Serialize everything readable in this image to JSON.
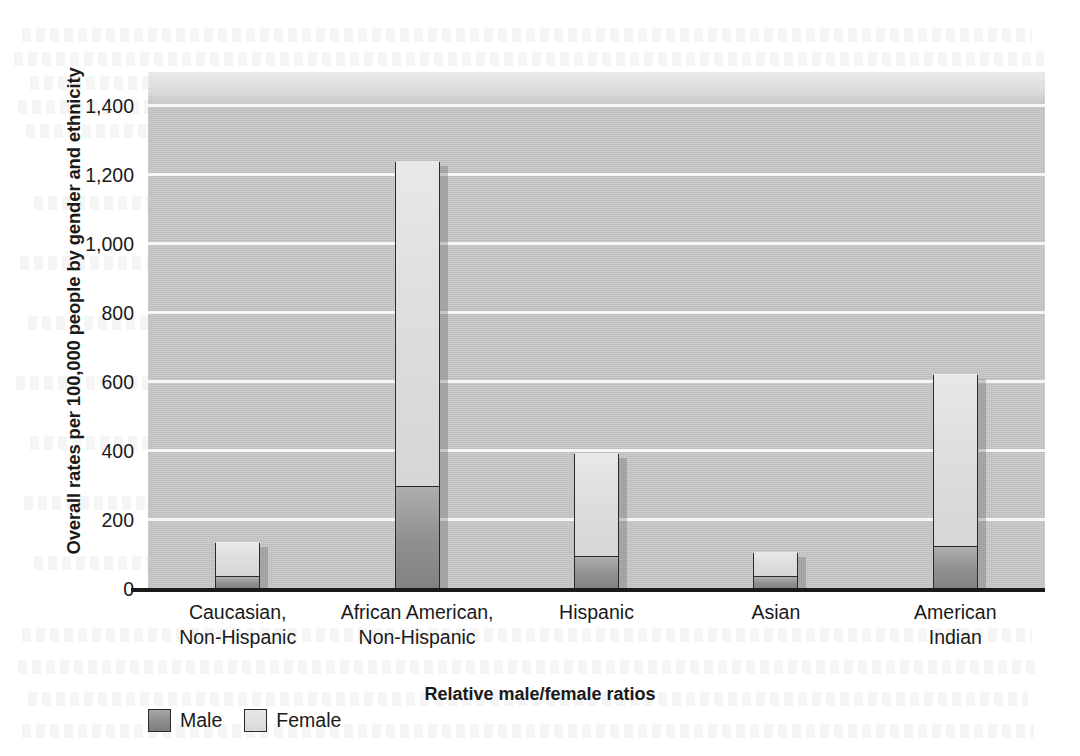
{
  "chart_data": {
    "type": "bar",
    "subtype": "stacked-bar",
    "title": "",
    "xlabel": "Relative male/female ratios",
    "ylabel": "Overall rates per 100,000 people by gender and ethnicity",
    "categories": [
      "Caucasian,\nNon-Hispanic",
      "African American,\nNon-Hispanic",
      "Hispanic",
      "Asian",
      "American\nIndian"
    ],
    "series": [
      {
        "name": "Male",
        "values": [
          35,
          295,
          94,
          35,
          123
        ]
      },
      {
        "name": "Female",
        "values": [
          102,
          945,
          301,
          73,
          499
        ]
      }
    ],
    "totals": [
      137,
      1240,
      395,
      108,
      622
    ],
    "ylim": [
      0,
      1500
    ],
    "yticks": [
      0,
      200,
      400,
      600,
      800,
      1000,
      1200,
      1400
    ],
    "ytick_labels": [
      "0",
      "200",
      "400",
      "600",
      "800",
      "1,000",
      "1,200",
      "1,400"
    ],
    "grid": true,
    "grid_axis": "y",
    "legend_position": "bottom-left",
    "colors": {
      "male": "#8a8a8a",
      "female": "#dedede",
      "plot_background": "#c9c9c9",
      "gridline": "#f6f6f6",
      "axis": "#1a1a1a",
      "page_background": "#ffffff"
    }
  },
  "legend": {
    "items": [
      {
        "label": "Male"
      },
      {
        "label": "Female"
      }
    ]
  }
}
